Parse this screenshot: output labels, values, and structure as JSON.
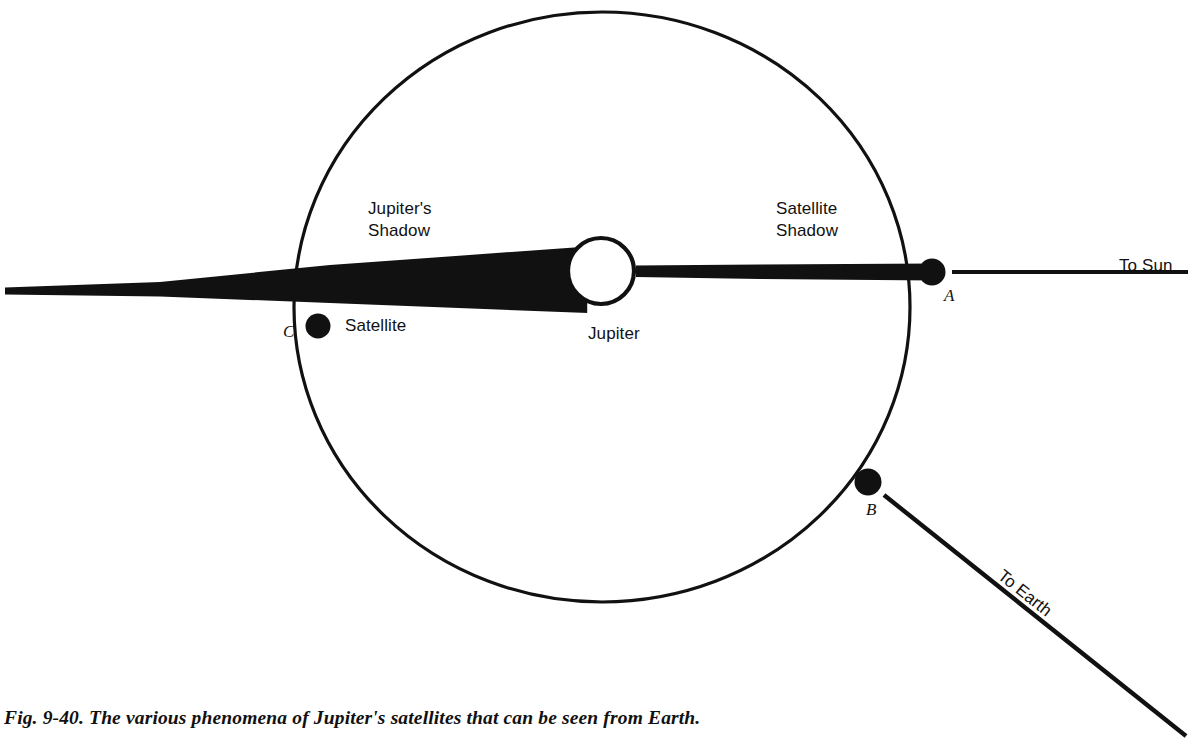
{
  "figure": {
    "caption": "Fig. 9-40. The various phenomena of Jupiter's satellites that can be seen from Earth.",
    "background_color": "#ffffff",
    "ink_color": "#111111"
  },
  "labels": {
    "jupiters_shadow_line1": "Jupiter's",
    "jupiters_shadow_line2": "Shadow",
    "satellite_shadow_line1": "Satellite",
    "satellite_shadow_line2": "Shadow",
    "satellite": "Satellite",
    "jupiter": "Jupiter",
    "to_sun": "To Sun",
    "to_earth": "To Earth"
  },
  "points": {
    "a": "A",
    "b": "B",
    "c": "C"
  },
  "diagram_data": {
    "type": "astronomy-schematic",
    "canvas": {
      "width": 1192,
      "height": 739
    },
    "orbit": {
      "name": "satellite-orbit",
      "center_x": 602,
      "center_y": 307,
      "radius_x": 308,
      "radius_y": 295,
      "stroke_width": 3.2,
      "filled": false
    },
    "jupiter": {
      "name": "jupiter-disk",
      "center_x": 601,
      "center_y": 271,
      "radius": 33,
      "fill": "#ffffff",
      "stroke": "#111111",
      "stroke_width": 4
    },
    "jupiter_shadow_cone": {
      "name": "jupiters-shadow-cone",
      "description": "long black tapering umbra extending left (anti-sunward) from Jupiter to the left edge",
      "base_x": 588,
      "base_top_y": 246,
      "base_bottom_y": 313,
      "tip_x": 5,
      "tip_top_y": 287,
      "tip_bottom_y": 295,
      "fill": "#111111"
    },
    "satellite_shadow_band": {
      "name": "satellite-shadow-band",
      "description": "thin black shadow cast by satellite A onto Jupiter, running right-to-left",
      "right_x": 934,
      "right_top_y": 264,
      "right_bottom_y": 280,
      "left_x": 634,
      "left_top_y": 266,
      "left_bottom_y": 278,
      "fill": "#111111"
    },
    "satellites": [
      {
        "id": "A",
        "name": "satellite-a",
        "cx": 932,
        "cy": 272,
        "r": 13,
        "fill": "#111111",
        "has_crescent_notch": true,
        "note": "satellite at superior position casting a shadow on Jupiter; small white crescent on its sunward-left limb"
      },
      {
        "id": "B",
        "name": "satellite-b",
        "cx": 868,
        "cy": 482,
        "r": 13,
        "fill": "#111111",
        "note": "satellite on the Earth-facing side of the orbit"
      },
      {
        "id": "C",
        "name": "satellite-c",
        "cx": 318,
        "cy": 326,
        "r": 12,
        "fill": "#111111",
        "note": "satellite entering Jupiter's shadow (eclipse)"
      }
    ],
    "rays": [
      {
        "name": "to-sun-ray",
        "label": "To Sun",
        "x1": 952,
        "y1": 272,
        "x2": 1188,
        "y2": 272,
        "stroke_width": 4,
        "angle_deg": 0
      },
      {
        "name": "to-earth-ray",
        "label": "To Earth",
        "x1": 886,
        "y1": 496,
        "x2": 1186,
        "y2": 735,
        "stroke_width": 4,
        "angle_deg": 38.5
      }
    ]
  }
}
